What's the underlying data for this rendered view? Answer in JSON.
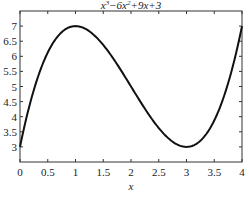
{
  "chart_data": {
    "type": "line",
    "title_parts": {
      "a": "x",
      "a_sup": "3",
      "b": "−6x",
      "b_sup": "2",
      "c": "+9x+3"
    },
    "xlabel": "x",
    "ylabel": "",
    "xlim": [
      0,
      4
    ],
    "ylim": [
      2.5,
      7.5
    ],
    "xticks": [
      0,
      0.5,
      1,
      1.5,
      2,
      2.5,
      3,
      3.5,
      4
    ],
    "xtick_labels": [
      "0",
      "0.5",
      "1",
      "1.5",
      "2",
      "2.5",
      "3",
      "3.5",
      "4"
    ],
    "yticks": [
      3,
      3.5,
      4,
      4.5,
      5,
      5.5,
      6,
      6.5,
      7
    ],
    "ytick_labels": [
      "3",
      "3.5",
      "4",
      "4.5",
      "5",
      "5.5",
      "6",
      "6.5",
      "7"
    ],
    "grid": false,
    "legend": null,
    "series": [
      {
        "name": "x^3-6x^2+9x+3",
        "color": "#111111",
        "x": [
          0,
          0.25,
          0.5,
          0.75,
          1,
          1.25,
          1.5,
          1.75,
          2,
          2.25,
          2.5,
          2.75,
          3,
          3.25,
          3.5,
          3.75,
          4
        ],
        "y": [
          3,
          4.7656,
          5.625,
          5.9219,
          6,
          5.6406,
          5.125,
          4.4844,
          5,
          4.2656,
          3.625,
          3.1094,
          3,
          3.1406,
          3.625,
          4.7969,
          7
        ]
      }
    ]
  }
}
